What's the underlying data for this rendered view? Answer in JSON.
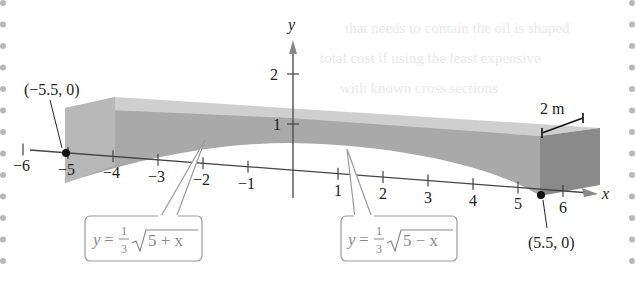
{
  "background_text": [
    "that needs to contain the oil is shaped",
    "total cost if using the least expensive",
    "with known cross sections"
  ],
  "axes": {
    "x_label": "x",
    "y_label": "y",
    "x_ticks": [
      "−6",
      "−5",
      "−4",
      "−3",
      "−2",
      "−1",
      "1",
      "2",
      "3",
      "4",
      "5",
      "6"
    ],
    "y_ticks": [
      "1",
      "2"
    ]
  },
  "points": [
    {
      "label": "(−5.5, 0)"
    },
    {
      "label": "(5.5, 0)"
    }
  ],
  "dimension_label": "2 m",
  "equations": [
    {
      "lhs": "y",
      "eq": "=",
      "num": "1",
      "den": "3",
      "radicand": "5 + x"
    },
    {
      "lhs": "y",
      "eq": "=",
      "num": "1",
      "den": "3",
      "radicand": "5 − x"
    }
  ],
  "colors": {
    "top_face": "#cfcfcf",
    "front_face": "#a9a9a9",
    "side_face": "#8a8a8a",
    "axis": "#444444",
    "margin_dots": "#b8b8b8"
  }
}
